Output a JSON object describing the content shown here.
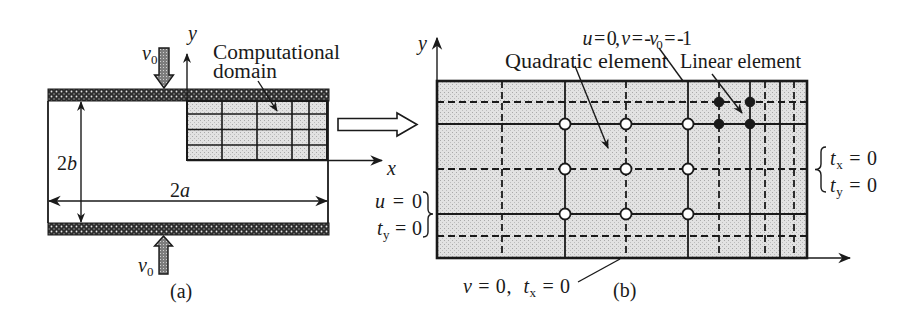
{
  "colors": {
    "ink": "#1a1a1a",
    "fill_light": "#e2e2e2",
    "wall": "#2e2e2e",
    "arrow_fill": "#7d7d7d",
    "background": "#ffffff"
  },
  "panel_a": {
    "caption": "(a)",
    "v0_top": {
      "symbol": "v",
      "subscript": "0"
    },
    "v0_bottom": {
      "symbol": "v",
      "subscript": "0"
    },
    "y_axis_label": "y",
    "x_axis_label": "x",
    "height_dimension": {
      "coef": "2",
      "var": "b"
    },
    "length_dimension": {
      "coef": "2",
      "var": "a"
    },
    "domain_label": {
      "line1": "Computational",
      "line2": "domain"
    },
    "mesh": {
      "columns": 5,
      "rows": 4
    }
  },
  "panel_b": {
    "caption": "(b)",
    "y_axis_label": "y",
    "top_bc": [
      {
        "t": "u"
      },
      {
        "t": " = 0, "
      },
      {
        "t": "v"
      },
      {
        "t": " = -"
      },
      {
        "t": "v"
      },
      {
        "t": "0"
      },
      {
        "t": " = -1"
      }
    ],
    "quadratic_label": "Quadratic element",
    "linear_label": "Linear element",
    "right_bc": {
      "line1": [
        {
          "t": "t"
        },
        {
          "t": "x"
        },
        {
          "t": " = 0"
        }
      ],
      "line2": [
        {
          "t": "t"
        },
        {
          "t": "y"
        },
        {
          "t": " = 0"
        }
      ]
    },
    "left_bc": {
      "line1": [
        {
          "t": "u"
        },
        {
          "t": " = 0"
        }
      ],
      "line2": [
        {
          "t": "t"
        },
        {
          "t": "y"
        },
        {
          "t": " = 0"
        }
      ]
    },
    "bottom_bc": [
      {
        "t": "v"
      },
      {
        "t": " = 0,  "
      },
      {
        "t": "t"
      },
      {
        "t": "x"
      },
      {
        "t": " = 0"
      }
    ],
    "quadratic_nodes": 9,
    "linear_nodes": 4
  }
}
